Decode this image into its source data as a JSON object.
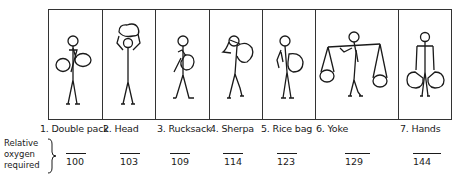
{
  "figure": {
    "panels": [
      {
        "id": 1,
        "label": "1. Double pack",
        "value": "100"
      },
      {
        "id": 2,
        "label": "2. Head",
        "value": "103"
      },
      {
        "id": 3,
        "label": "3. Rucksack",
        "value": "109"
      },
      {
        "id": 4,
        "label": "4. Sherpa",
        "value": "114"
      },
      {
        "id": 5,
        "label": "5. Rice bag",
        "value": "123"
      },
      {
        "id": 6,
        "label": "6. Yoke",
        "value": "129"
      },
      {
        "id": 7,
        "label": "7. Hands",
        "value": "144"
      }
    ],
    "row_label": {
      "line1": "Relative",
      "line2": "oxygen",
      "line3": "required"
    }
  }
}
